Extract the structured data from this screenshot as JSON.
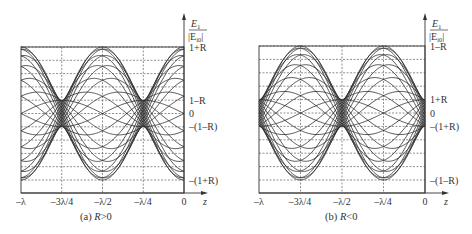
{
  "chart_data": [
    {
      "type": "line",
      "panel": "a",
      "title": "(a) R>0",
      "caption_prefix": "(a) ",
      "caption_var": "R",
      "caption_cond": ">0",
      "xlabel": "z",
      "ylabel_num": "E",
      "ylabel_num_sub": "1",
      "ylabel_den": "|E",
      "ylabel_den_sub": "i0",
      "ylabel_den_close": "|",
      "x_ticks": [
        "-λ",
        "-3λ/4",
        "-λ/2",
        "-λ/4",
        "0"
      ],
      "x_range": [
        "-λ",
        "0"
      ],
      "y_ticks": [
        "1+R",
        "1-R",
        "0",
        "-(1-R)",
        "-(1+R)"
      ],
      "grid": "dashed",
      "R": 0.67,
      "description": "Instantaneous standing-wave curves E1/|Ei0| = cos(ωt+βz) + R·cos(ωt−βz) for several phases ωt; envelope maxima 1+R at z=0, -λ/2, -λ; minima 1-R at z=-λ/4, -3λ/4",
      "series_phases_deg": [
        0,
        15,
        30,
        45,
        60,
        75,
        90,
        105,
        120,
        135,
        150,
        165
      ]
    },
    {
      "type": "line",
      "panel": "b",
      "title": "(b) R<0",
      "caption_prefix": "(b) ",
      "caption_var": "R",
      "caption_cond": "<0",
      "xlabel": "z",
      "ylabel_num": "E",
      "ylabel_num_sub": "1",
      "ylabel_den": "|E",
      "ylabel_den_sub": "i0",
      "ylabel_den_close": "|",
      "x_ticks": [
        "-λ",
        "-3λ/4",
        "-λ/2",
        "-λ/4",
        "0"
      ],
      "x_range": [
        "-λ",
        "0"
      ],
      "y_ticks": [
        "1-R",
        "1+R",
        "0",
        "-(1+R)",
        "-(1-R)"
      ],
      "grid": "dashed",
      "R": -0.67,
      "description": "Instantaneous standing-wave curves E1/|Ei0| = cos(ωt+βz) + R·cos(ωt−βz) for several phases ωt; envelope maxima 1-R at z=-λ/4, -3λ/4; minima 1+R at z=0, -λ/2, -λ",
      "series_phases_deg": [
        0,
        15,
        30,
        45,
        60,
        75,
        90,
        105,
        120,
        135,
        150,
        165
      ]
    }
  ],
  "panels": {
    "a": {
      "caption_prefix": "(a) ",
      "caption_var": "R",
      "caption_cond": ">0",
      "y_labels": [
        "1+R",
        "1–R",
        "0",
        "–(1–R)",
        "–(1+R)"
      ],
      "x_labels": [
        "–λ",
        "–3λ/4",
        "–λ/2",
        "–λ/4",
        "0"
      ],
      "xlabel": "z"
    },
    "b": {
      "caption_prefix": "(b) ",
      "caption_var": "R",
      "caption_cond": "<0",
      "y_labels": [
        "1–R",
        "1+R",
        "0",
        "–(1+R)",
        "–(1–R)"
      ],
      "x_labels": [
        "–λ",
        "–3λ/4",
        "–λ/2",
        "–λ/4",
        "0"
      ],
      "xlabel": "z"
    },
    "ylabel": {
      "num": "E",
      "num_sub": "1",
      "den": "|E",
      "den_sub": "i0",
      "den_close": "|"
    }
  },
  "colors": {
    "curve": "#2a2a2a",
    "grid": "#444444",
    "axis": "#333333"
  }
}
